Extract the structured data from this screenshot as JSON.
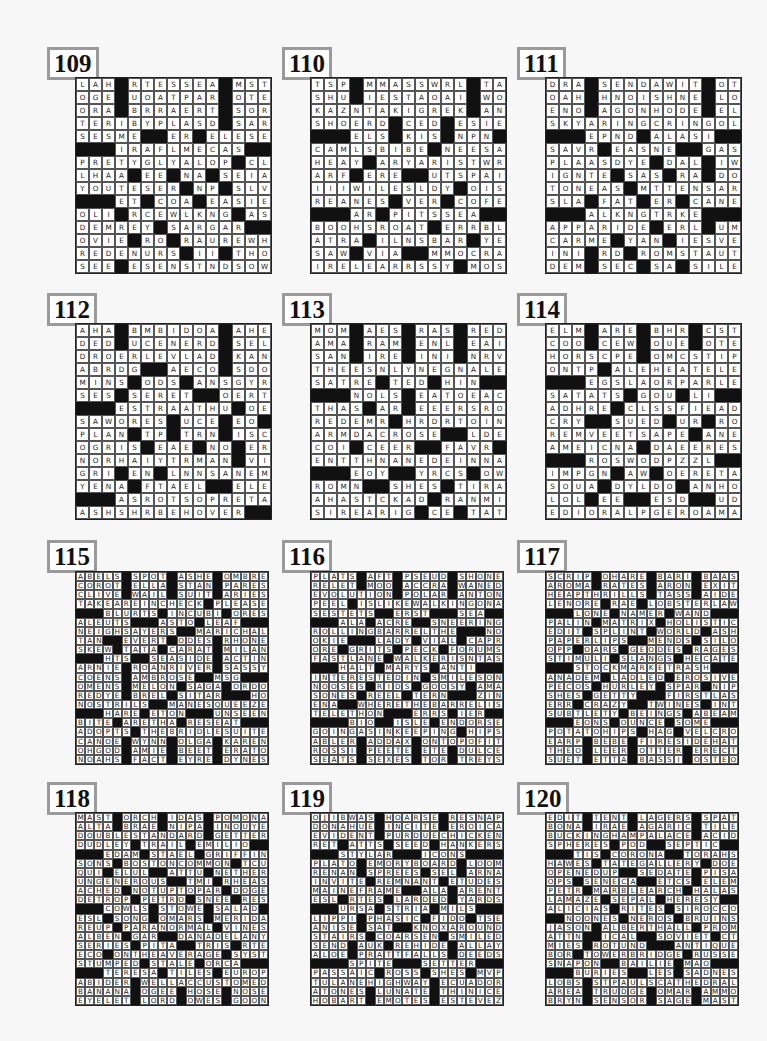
{
  "page": {
    "background": "#f7f7f7"
  },
  "puzzles": [
    {
      "number": "109",
      "size": 15,
      "grid": [
        "LAHR#RATES#SERA#MASTS",
        "OGEE#UBOAT#PAIR#OCTET",
        "ORAD#BERRA#ERST#STORE",
        "TERRIBLYPLEASED#SNARE",
        "SESAMES##ERR#RELEASED",
        "###FIR#AFLAME#CAST###",
        "PRETTYUGLY#ALSOP#UCLA",
        "LHASA#NEE#GNAW#SERIAL",
        "YOU#TESSERA#NAP#SALVE",
        "###FETE#COLA#MEASLIER",
        "OLIO#RACEWALKING#LAST",
        "DEMURELY#STAR#GARY###",
        "OVINE#SRO#ERASURE#WHY",
        "REDDEN#URSA#ICI#TAHOE",
        "SEEM#ESSEN#STANDSDOWN",
        "###INIT#LATEST#RID###",
        "TASSELED#CON##MANIPLE",
        "ANISE#WORKINGVACATION",
        "TONIS#ARAB#ELIHU#INGA",
        "ADANO#RITA#TONAL#OTIC",
        "REIGN#TSAR#TWYLA#NOCT"
      ]
    },
    {
      "number": "110",
      "size": 15,
      "grid": [
        "TSPS#MAMAS#SWIRL#PTAS",
        "SHUE#IDEST#AODAI#AWOL",
        "KAZANTZAKISGREEK#MANY",
        "SHOWERED#COEDS#ESPIES",
        "###SELES#SKITS#UNPEN##",
        "CAMELS#BIBLE#SNEERSAT",
        "HEADY#CARYSARTIST#WRY",
        "ARFS#ERIE##OUTS#PAIL",
        "III#WILDESLADY#BOISE",
        "REALNESS#VEERS#CONFER",
        "###AARP#PINTS#SEAT###",
        "BOOTHS#ROAST#TERRIBLE",
        "ATRIA#MILNESBEAR##YEA",
        "SAWN#VIVA##AMMO#CRAG",
        "IRE#LECARRESSPY#MOOSE",
        "CULTURAL#ESTEE#TANNER",
        "###LUCAS#BASAL#BANNS##",
        "LISTEN#ALDER#MEMOIRES",
        "USPO#DEFOESMANSERVANT",
        "MEIR#ATTAR#ALGER#EKCO",
        "PEGS#SCATS#PARTS#DEEP"
      ]
    },
    {
      "number": "111",
      "size": 15,
      "grid": [
        "DRAB#SPEND#AWAIT#JOTS",
        "OAHU#HANOI#SHINE#ALOE",
        "ENOL#ARGON#HORDE#YELL",
        "SKYLARKING#CRYINGWOLF",
        "###DEPEND#HAL#ASIA###",
        "SAVOR#REASONER##GLASS",
        "PLAZAS#DYER#DUAL#KIWI",
        "IGNITED#SASS#BRA#IDOL",
        "TONNEAUS#MITT#ENSNARL",
        "SLAG#FLAT#NERO#CAGNEY",
        "###TALKINGTURKEY####",
        "APPEAR#IDEA#EARL#HUMP",
        "CARAMEL#YARN#LIESOVER",
        "INIT#RID#ROOM#STATUTE",
        "DEMI#SPEC#USAF#SIDLES",
        "SLANT##CORNERED#GOADS",
        "###GIBE#ROD#ANALOG###",
        "CATCALLING#DUCKINGOUT",
        "ODOR#OSSIE#IDIOT#IDLE",
        "RENO#OILER#RENTE#NINA",
        "KNEW#PEERS#EDGAR#GEAR"
      ]
    },
    {
      "number": "112",
      "size": 15,
      "grid": [
        "AHAB#BAMBI#DORA#ASHER",
        "DEDE#UNCENTERED#STELE",
        "DROVERCLEVELAND#KOANS",
        "ABRIDGE##ALECTO#SODOM",
        "MINES#ODDS#HANS#GYRE",
        "SESS#SECRETS##OMERTA",
        "###JESTERAARTHUR#OER",
        "SAWHORSES#RUCHE#ETO##",
        "PLAIN#TSP#TARN#DISCH",
        "OGREISH#EASE#UNO#EERO",
        "NOR#HAIRYTRUMAN##VIN",
        "GRIP#ERN#LYNN#SANREMO",
        "YENTA#AFTA#ELS##EELER",
        "###GAS#ROUTS#OPERETTAS",
        "ASH#SHERBETHOOVER####",
        "CHASTE###ROOSTED#ORBS",
        "CART#BALD#MAES##SCARY",
        "ORDER#SURTAX##TOUCHED",
        "SPIRO#SMARTENVANBUREN",
        "TINED#APPEARANCE#LAZE",
        "SEGOS#DYES#STATS#THEY"
      ]
    },
    {
      "number": "113",
      "size": 15,
      "grid": [
        "MOMS#AMES#ARABS#REEDS",
        "AMAH#ROAM#RENAL#EMAIL",
        "SANA#INRE#SINAI#NERVE",
        "THERESONLYONE#GNARLED",
        "SATIRES#TEND#THING###",
        "###ANOLES#ERATO#EACH",
        "THATS#MAR#TEETERS#ROO",
        "REDEEMER#HARDERTOFIND",
        "ARMADA#CROSSE###LADES",
        "COIL#CHEERS###FAVOR##",
        "ENT#THANANEEDLEIN#NAT",
        "###PEONY##LYRICS#HOWE",
        "ROMAN###SHIEST#TIARAS",
        "AHAYSTACKAND#TRANSMIT",
        "SIR#EARRING##CEO#THATS",
        "POTS#BRAND#ARROYO####",
        "###ACLAM#ISLE#TATTING",
        "BRADLEY#INCLAMCHOWDER",
        "LINDA#ADAGE#TARO#ILIA",
        "ALTER#LOGON#OMOO#CELT",
        "BLINK#SCONE#REPS#ESSE"
      ]
    },
    {
      "number": "114",
      "size": 15,
      "grid": [
        "ELMS#ACRE#ABHOR#COSTA",
        "COOT#CREW#ROUTE#OATES",
        "HOROSCOPE#COMICSTRIPS",
        "ONTOP#SALE#HECATE#LEA",
        "###LEGISLATOR#PAROLED",
        "SATIATES#GROUP#LID###",
        "ADHERER#CLASSIFIEDADS",
        "CRY###SLUED##URN#ROT",
        "REMOVE#ETS#APSE#APNEA",
        "AMERICANA#IDA#EERIEST",
        "###CROSSWORDPUZZLE###",
        "IMPUGNS#AWE#OPERETTAS",
        "SOUSA#IDYL#DOT#ANYHOW",
        "LOL##ESE##RESOD###UDE",
        "EDITORIALPAGE#ROADMAP",
        "###OPA#LARGE#DECREPIT",
        "CALYPSO#NEARMISSES###",
        "ARE#REMEDY#MORS#AKRON",
        "MOVIEREVIEW#LEADSTORY",
        "USERS#GENRE#ALGA#OISE",
        "SEEKS#ANGST#RYES#PLOT"
      ]
    },
    {
      "number": "115",
      "size": 21,
      "grid": [
        "ABELS#SPOT#ASHE#OMBRE",
        "COROT#ELLA#STAN#PARES",
        "CLIVE#WAIL#SUIT#ARIES",
        "TAKEAREINCHECK#PLEASE",
        "###BLURTS#INCUBI#ORES",
        "ALEUTS###ASTO#LEAF###",
        "NEIGHSAYERS##MARICHAL",
        "TAN##EVERT#ODES#RHONE",
        "SKEW#TATA#CARAT#MILAN",
        "###HTS##SEASIDE#ACTIN",
        "ARNIE#ROANRIVER#SASSY",
        "COENS#AMBROSE##MSG###",
        "OMENS#MELON#SAGA#ORDO",
        "REDYE#BREL#SITAR###HOP",
        "NOSTRILS##MANESQUEEZE",
        "###HARE#ETON###UNSEEN",
        "BITE#ARETHA#RESEAT###",
        "ADOPTS#THEBRIDLESUITE",
        "CANOE#WYNN#OLGA#KAREN",
        "OHGOD#AMIE#BEET#ERATO",
        "NOAHS#FACT#EYRE#DYNES"
      ]
    },
    {
      "number": "116",
      "size": 21,
      "grid": [
        "PLATS#AFT#PSEUD#SHONE",
        "RELET#MOO#ACCRA#WANED",
        "EVOLUTION#POLAR#ANTON",
        "PEEL#ISLIKEWALKINGONA",
        "SESTETS##ERST###SEA###",
        "###ALA#ACRE##SNEERING",
        "ROLLINGBARRELTHE###NOR",
        "OKIE###LADY#VIAL#CAPRA",
        "ORE#GRITS#PECK#FORUMS",
        "FASTLANE#WALKERISNTAS",
        "###HALT#MARYS#ANTI###",
        "INTERESTEDIN#SMILESON",
        "NOOSES#RIDS#GOOSY#AMA",
        "SONES#REEL#TERN###ZING",
        "ENA##WHERETHEBARRELIS",
        "TELETHON###ERRS#IER###",
        "###BIO##ISLE#ENDORSE",
        "GOINGASINKEEPING#HIPS",
        "ABLER#ADDAX#ONTOPOFIT",
        "ROSSI#PEETE#ETE#DULCE",
        "SEATS#SEXES#TOR#TREYS"
      ]
    },
    {
      "number": "117",
      "size": 21,
      "grid": [
        "SCRIP#OHARE#BARI#BAAS",
        "AROMA#RATES#ARON#EXIT",
        "HEAPTHRILLS#TASS#AIDE",
        "LENORE#RAE#LOBSTERLAW",
        "###LONE#NAMER#WAND###",
        "PALIN#MATRIX#HOLISTIC",
        "EDIT#SPLINT#WORLD#ASH",
        "PAPERLIPS##MENDS#SILO",
        "OPP#OARS#GEODES#RAGES",
        "STIMULI#SLANGS#HECATE",
        "###STOCKMARKETRASH###",
        "ANADEM#LADLED#EROSIVE",
        "PECOS#HURLEY#SPAR#NIP",
        "SHES#GETTY###FIRSTLASS",
        "ERR#CRAZY##TWINES#INTO",
        "SUBTLETY#BEINGS#ABEAM",
        "###EONS#OUNCE#SOME###",
        "POTATOHIPS#HAG#VELCRO",
        "EARP#BEBE#FIRESIDEHAT",
        "THEO#LEER#OTTER#ERECT",
        "SUET#ETTA#BASSI#OSTEO"
      ]
    },
    {
      "number": "118",
      "size": 21,
      "grid": [
        "MAST#ORCH#IDAS#POMONA",
        "ALTA#BRAE#NIPA#INOUYE",
        "DOUBLESTANDARD#GETTER",
        "DUDLEY#TRAIL#EMILIO##",
        "###EDAM#STAEL#GRIFFIN",
        "SONS#BOSTONCOMMON#TCU",
        "QUI#ELUL##ATTU#NETHER",
        "UNGENEROUS##TMI#RHEAS",
        "ACHED#NOTUPTOPAR#DOGE",
        "DETROP#PETRO#SNEE#RES",
        "###COWLS#STOWE#SALAD##",
        "ESL#SONG#OMARS#MERIDA",
        "REUP#PARANORMAL#VINES",
        "ALBEN#GAR##DANADELANY",
        "SERIES#PITA##TRIS#RTE",
        "ECO#ONTHEAVERAGE#SYST",
        "STUMPED#STALE#ORCA###",
        "###TERESA#TILES#EUROPE",
        "ABIDER#WELLACCUSTOMED",
        "BANANA#OGEE#HOSE#NOSE",
        "EYELET#LORD#OWES#GOON"
      ]
    },
    {
      "number": "119",
      "size": 21,
      "grid": [
        "OJIBWAS#HOARSE#RESNAP",
        "DONAHUE#INCITE#EROICA",
        "EVIDENT#PURDUECHICKEN",
        "RET#ATTS#SEED#HANKERS",
        "###STYLAR###ICONS####",
        "PLATO#EMORYBOARD#LOOM",
        "RENAN#SPREES#SEL#ARNA",
        "INVITE#REMNANT#ETUDES",
        "MAINEFRAME##ALA#ARENT",
        "ESL#RTES#LARDED#YARDS",
        "###URSA#STRIA#MILS###",
        "LIPPI#PHASIC#FIDO#TSE",
        "ANISE#SAT##KNOXAROUND",
        "STAIRS#COARSEN#SMILED",
        "SEND#AUK#REHIDE#ALLAY",
        "ALOE#PRATTFALLS#DEEDS",
        "####SPITE###SETTER####",
        "PASSAIC#ROSS#SHES#MVP",
        "TULANEHIGHWAY#ECUADOR",
        "ATONES#LUNATE#THINICE",
        "HOBART#EMOTES#ESTEVEZ"
      ]
    },
    {
      "number": "120",
      "size": 21,
      "grid": [
        "EDIT#TENT#LAGERS#SPAT",
        "BONA#IRAE#AGARIC#TILE",
        "BUCKINGHAMPALACE#ACID",
        "SPHERES#POD##SEPTIC##",
        "###TIS#CORONA##TORAHS",
        "HAWES#TATEGALLERY#DOE",
        "OPENEDUP##SEDATE#PISA",
        "OPS#SENECA##ETCS#ELEM",
        "PETR#MARBLEARCH#HALAS",
        "LAMAZE#SEPAL#HERESY##",
        "ALICIAS#RITES#SIROCCO",
        "##NOONES#NEROS#BRUINS",
        "JASON#ALBERTHALL#PROM",
        "ATTN##ICAL##SOVIET#CTO",
        "MIES#ROTUND###ANTIQUES",
        "BOR#TOWERBRIDGE#RUSSE",
        "SNAPON##BAILIE#MAO###",
        "###BURIES##LES#SADNESS",
        "LOBS#STPAULSCATHEDRAL",
        "AREA#TRUDGE#OMAR#AMMO",
        "BRYN#SENSOR#SAGE#MAST"
      ]
    }
  ]
}
